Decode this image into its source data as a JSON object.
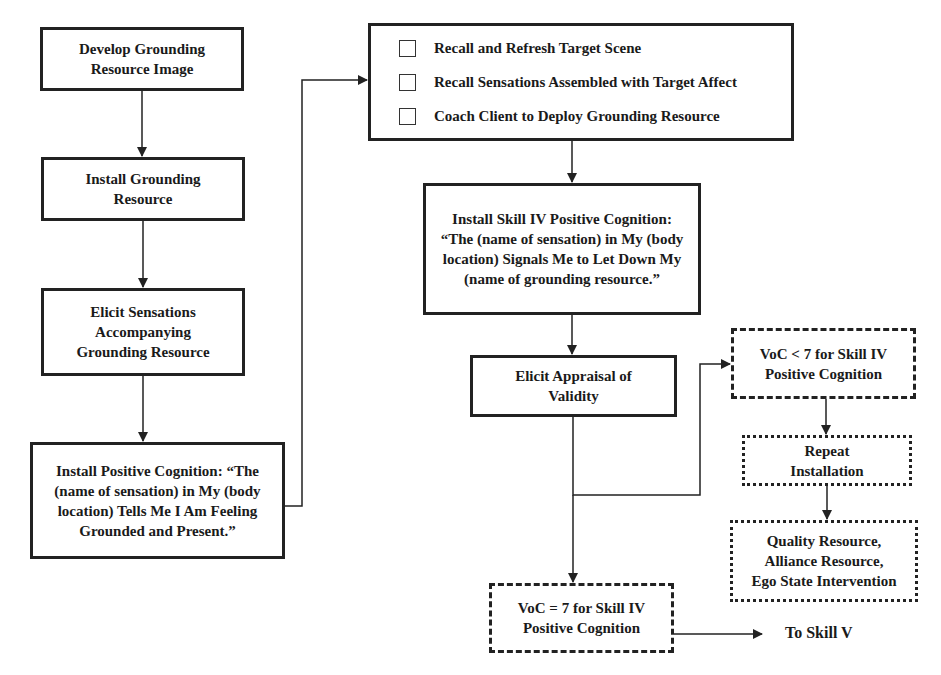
{
  "diagram": {
    "left_column": [
      {
        "id": "develop",
        "lines": [
          "Develop Grounding",
          "Resource Image"
        ]
      },
      {
        "id": "install-grounding",
        "lines": [
          "Install Grounding",
          "Resource"
        ]
      },
      {
        "id": "elicit-sensations",
        "lines": [
          "Elicit Sensations",
          "Accompanying",
          "Grounding Resource"
        ]
      },
      {
        "id": "install-pc",
        "lines": [
          "Install Positive Cognition:  “The",
          "(name of sensation) in My (body",
          "location) Tells Me I Am Feeling",
          "Grounded and Present.”"
        ]
      }
    ],
    "checklist": {
      "items": [
        "Recall and Refresh Target Scene",
        "Recall Sensations Assembled with Target Affect",
        "Coach Client to Deploy Grounding Resource"
      ]
    },
    "install_skill_iv": {
      "lines": [
        "Install Skill IV Positive Cognition:",
        "“The (name of sensation) in My (body",
        "location) Signals Me to Let Down My",
        "(name of grounding resource.”"
      ]
    },
    "elicit_appraisal": {
      "lines": [
        "Elicit Appraisal of",
        "Validity"
      ]
    },
    "voc_less": {
      "lines": [
        "VoC < 7 for Skill  IV",
        "Positive Cognition"
      ]
    },
    "repeat": {
      "lines": [
        "Repeat",
        "Installation"
      ]
    },
    "quality": {
      "lines": [
        "Quality Resource,",
        "Alliance Resource,",
        "Ego State Intervention"
      ]
    },
    "voc_equal": {
      "lines": [
        "VoC = 7 for Skill IV",
        "Positive Cognition"
      ]
    },
    "to_skill_v": "To Skill V"
  }
}
